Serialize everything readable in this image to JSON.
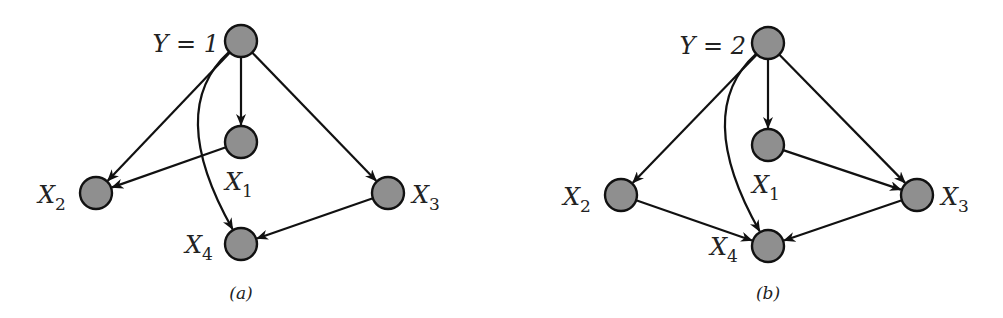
{
  "figure": {
    "node_radius": 16,
    "node_fill": "#8f8f8f",
    "node_stroke": "#111111",
    "edge_color": "#111111",
    "panels": [
      {
        "id": "a",
        "caption": "(a)",
        "caption_pos": [
          241,
          299
        ],
        "nodes": [
          {
            "id": "Y",
            "label": "Y = 1",
            "main": "Y = 1",
            "sub": "",
            "x": 241,
            "y": 41,
            "label_x": 219,
            "label_y": 52,
            "anchor": "end"
          },
          {
            "id": "X1",
            "label": "X1",
            "main": "X",
            "sub": "1",
            "x": 241,
            "y": 142,
            "label_x": 225,
            "label_y": 190,
            "anchor": "start"
          },
          {
            "id": "X2",
            "label": "X2",
            "main": "X",
            "sub": "2",
            "x": 96,
            "y": 193,
            "label_x": 38,
            "label_y": 203,
            "anchor": "start"
          },
          {
            "id": "X3",
            "label": "X3",
            "main": "X",
            "sub": "3",
            "x": 388,
            "y": 193,
            "label_x": 412,
            "label_y": 203,
            "anchor": "start"
          },
          {
            "id": "X4",
            "label": "X4",
            "main": "X",
            "sub": "4",
            "x": 241,
            "y": 244,
            "label_x": 185,
            "label_y": 253,
            "anchor": "start"
          }
        ],
        "edges": [
          {
            "from": "Y",
            "to": "X1",
            "type": "straight"
          },
          {
            "from": "Y",
            "to": "X2",
            "type": "straight"
          },
          {
            "from": "Y",
            "to": "X3",
            "type": "straight"
          },
          {
            "from": "Y",
            "to": "X4",
            "type": "curved",
            "ctrl": [
              165,
              110
            ]
          },
          {
            "from": "X1",
            "to": "X2",
            "type": "straight"
          },
          {
            "from": "X3",
            "to": "X4",
            "type": "straight"
          }
        ]
      },
      {
        "id": "b",
        "caption": "(b)",
        "caption_pos": [
          768,
          299
        ],
        "nodes": [
          {
            "id": "Y",
            "label": "Y = 2",
            "main": "Y = 2",
            "sub": "",
            "x": 768,
            "y": 43,
            "label_x": 746,
            "label_y": 54,
            "anchor": "end"
          },
          {
            "id": "X1",
            "label": "X1",
            "main": "X",
            "sub": "1",
            "x": 768,
            "y": 145,
            "label_x": 752,
            "label_y": 193,
            "anchor": "start"
          },
          {
            "id": "X2",
            "label": "X2",
            "main": "X",
            "sub": "2",
            "x": 621,
            "y": 195,
            "label_x": 563,
            "label_y": 205,
            "anchor": "start"
          },
          {
            "id": "X3",
            "label": "X3",
            "main": "X",
            "sub": "3",
            "x": 917,
            "y": 195,
            "label_x": 941,
            "label_y": 205,
            "anchor": "start"
          },
          {
            "id": "X4",
            "label": "X4",
            "main": "X",
            "sub": "4",
            "x": 768,
            "y": 246,
            "label_x": 710,
            "label_y": 255,
            "anchor": "start"
          }
        ],
        "edges": [
          {
            "from": "Y",
            "to": "X1",
            "type": "straight"
          },
          {
            "from": "Y",
            "to": "X2",
            "type": "straight"
          },
          {
            "from": "Y",
            "to": "X3",
            "type": "straight"
          },
          {
            "from": "Y",
            "to": "X4",
            "type": "curved",
            "ctrl": [
              692,
              112
            ]
          },
          {
            "from": "X1",
            "to": "X3",
            "type": "straight"
          },
          {
            "from": "X2",
            "to": "X4",
            "type": "straight"
          },
          {
            "from": "X3",
            "to": "X4",
            "type": "straight"
          }
        ]
      }
    ]
  }
}
